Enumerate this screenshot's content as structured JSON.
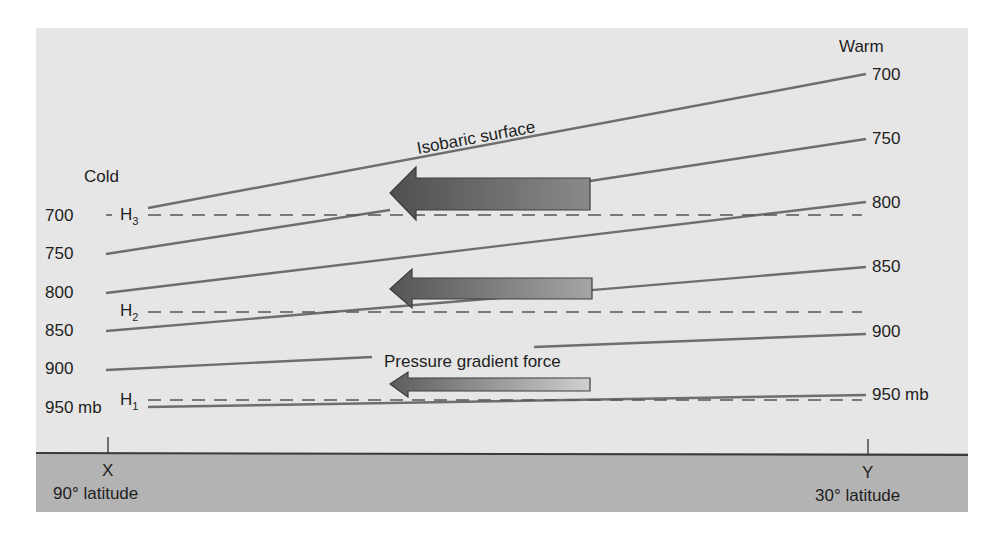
{
  "labels": {
    "cold": "Cold",
    "warm": "Warm",
    "isobaric_surface": "Isobaric surface",
    "pressure_gradient_force": "Pressure gradient force",
    "point_x": "X",
    "point_y": "Y",
    "lat_x": "90° latitude",
    "lat_y": "30° latitude"
  },
  "left_pressures": [
    "700",
    "750",
    "800",
    "850",
    "900",
    "950 mb"
  ],
  "right_pressures": [
    "700",
    "750",
    "800",
    "850",
    "900",
    "950 mb"
  ],
  "heights": [
    {
      "letter": "H",
      "sub": "3"
    },
    {
      "letter": "H",
      "sub": "2"
    },
    {
      "letter": "H",
      "sub": "1"
    }
  ],
  "colors": {
    "panel_bg": "#e6e6e6",
    "ground": "#b3b3b3",
    "isobar": "#6e6e6e",
    "arrow_dark": "#5a5a5a",
    "arrow_light": "#bdbdbd"
  }
}
